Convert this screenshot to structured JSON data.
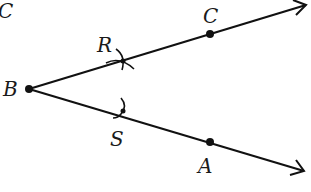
{
  "diagram": {
    "type": "angle-bisector-construction",
    "colors": {
      "stroke": "#111111",
      "background": "#ffffff",
      "text": "#1a1a1a"
    },
    "labels": {
      "corner": "C",
      "vertex": "B",
      "upper_arc": "R",
      "upper_point": "C",
      "lower_arc": "S",
      "lower_point": "A"
    },
    "points": {
      "B": [
        29,
        89
      ],
      "R": [
        122,
        61
      ],
      "C": [
        210,
        34
      ],
      "S": [
        123,
        111
      ],
      "A": [
        210,
        142
      ]
    },
    "rays": [
      {
        "from": "B",
        "through": "C",
        "tip": [
          307,
          4
        ]
      },
      {
        "from": "B",
        "through": "A",
        "tip": [
          305,
          171
        ]
      }
    ]
  }
}
